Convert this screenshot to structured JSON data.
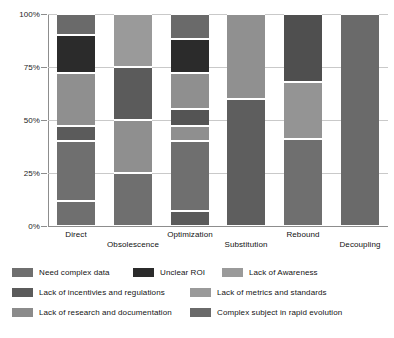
{
  "chart_data": {
    "type": "bar",
    "subtype": "stacked-percentage",
    "title": "",
    "subtitle": "",
    "xlabel": "",
    "ylabel": "",
    "ylim": [
      0,
      100
    ],
    "grid": true,
    "legend_position": "bottom",
    "categories": [
      "Direct",
      "Obsolescence",
      "Optimization",
      "Substitution",
      "Rebound",
      "Decoupling"
    ],
    "ytick_labels": [
      "0%",
      "25%",
      "50%",
      "75%",
      "100%"
    ],
    "ytick_values": [
      0,
      25,
      50,
      75,
      100
    ],
    "series": [
      {
        "name": "Need complex data",
        "color": "#6f6f6f",
        "values": [
          12,
          25,
          33,
          0,
          41,
          100
        ]
      },
      {
        "name": "Unclear ROI",
        "color": "#2b2b2b",
        "values": [
          0,
          0,
          7,
          0,
          0,
          0
        ]
      },
      {
        "name": "Lack of Awareness",
        "color": "#9a9a9a",
        "values": [
          0,
          25,
          0,
          0,
          0,
          0
        ]
      },
      {
        "name": "Lack of incentivies and regulations",
        "color": "#5b5b5b",
        "values": [
          28,
          0,
          0,
          60,
          0,
          0
        ]
      },
      {
        "name": "Lack of metrics and standards",
        "color": "#9a9a9a",
        "values": [
          0,
          0,
          7,
          0,
          0,
          0
        ]
      },
      {
        "name": "Lack of research and documentation",
        "color": "#8b8b8b",
        "values": [
          0,
          0,
          0,
          0,
          0,
          0
        ]
      },
      {
        "name": "Complex subject in rapid evolution",
        "color": "#6a6a6a",
        "values": [
          0,
          0,
          0,
          0,
          0,
          0
        ]
      }
    ],
    "stacks": [
      {
        "category": "Direct",
        "segments": [
          {
            "label": "Need complex data",
            "start": 0,
            "end": 12,
            "value": 12,
            "color": "#6f6f6f"
          },
          {
            "label": "Lack of incentivies and regulations",
            "start": 12,
            "end": 40,
            "value": 28,
            "color": "#6f6f6f"
          },
          {
            "label": "Lack of metrics and standards",
            "start": 40,
            "end": 47,
            "value": 7,
            "color": "#5b5b5b"
          },
          {
            "label": "Lack of research and documentation",
            "start": 47,
            "end": 72,
            "value": 25,
            "color": "#8f8f8f"
          },
          {
            "label": "Unclear ROI",
            "start": 72,
            "end": 90,
            "value": 18,
            "color": "#2b2b2b"
          },
          {
            "label": "Complex subject in rapid evolution",
            "start": 90,
            "end": 100,
            "value": 10,
            "color": "#6a6a6a"
          }
        ]
      },
      {
        "category": "Obsolescence",
        "segments": [
          {
            "label": "Need complex data",
            "start": 0,
            "end": 25,
            "value": 25,
            "color": "#6f6f6f"
          },
          {
            "label": "Lack of research and documentation",
            "start": 25,
            "end": 50,
            "value": 25,
            "color": "#8f8f8f"
          },
          {
            "label": "Lack of incentivies and regulations",
            "start": 50,
            "end": 75,
            "value": 25,
            "color": "#5b5b5b"
          },
          {
            "label": "Lack of Awareness",
            "start": 75,
            "end": 100,
            "value": 25,
            "color": "#9a9a9a"
          }
        ]
      },
      {
        "category": "Optimization",
        "segments": [
          {
            "label": "Lack of incentivies and regulations",
            "start": 0,
            "end": 7,
            "value": 7,
            "color": "#5b5b5b"
          },
          {
            "label": "Need complex data",
            "start": 7,
            "end": 40,
            "value": 33,
            "color": "#6f6f6f"
          },
          {
            "label": "Lack of metrics and standards",
            "start": 40,
            "end": 47,
            "value": 7,
            "color": "#8f8f8f"
          },
          {
            "label": "Complex subject in rapid evolution",
            "start": 47,
            "end": 55,
            "value": 8,
            "color": "#545454"
          },
          {
            "label": "Lack of research and documentation",
            "start": 55,
            "end": 72,
            "value": 17,
            "color": "#8f8f8f"
          },
          {
            "label": "Unclear ROI",
            "start": 72,
            "end": 88,
            "value": 16,
            "color": "#2b2b2b"
          },
          {
            "label": "Lack of Awareness",
            "start": 88,
            "end": 100,
            "value": 12,
            "color": "#6a6a6a"
          }
        ]
      },
      {
        "category": "Substitution",
        "segments": [
          {
            "label": "Lack of incentivies and regulations",
            "start": 0,
            "end": 60,
            "value": 60,
            "color": "#5e5e5e"
          },
          {
            "label": "Lack of Awareness",
            "start": 60,
            "end": 100,
            "value": 40,
            "color": "#909090"
          }
        ]
      },
      {
        "category": "Rebound",
        "segments": [
          {
            "label": "Need complex data",
            "start": 0,
            "end": 41,
            "value": 41,
            "color": "#6f6f6f"
          },
          {
            "label": "Lack of Awareness",
            "start": 41,
            "end": 68,
            "value": 27,
            "color": "#949494"
          },
          {
            "label": "Lack of incentivies and regulations",
            "start": 68,
            "end": 100,
            "value": 32,
            "color": "#4f4f4f"
          }
        ]
      },
      {
        "category": "Decoupling",
        "segments": [
          {
            "label": "Need complex data",
            "start": 0,
            "end": 100,
            "value": 100,
            "color": "#6a6a6a"
          }
        ]
      }
    ]
  },
  "legend": {
    "items": [
      {
        "label": "Need complex data",
        "color": "#6f6f6f"
      },
      {
        "label": "Unclear ROI",
        "color": "#2b2b2b"
      },
      {
        "label": "Lack of Awareness",
        "color": "#9a9a9a"
      },
      {
        "label": "Lack of incentivies and regulations",
        "color": "#5b5b5b"
      },
      {
        "label": "Lack of metrics and standards",
        "color": "#9a9a9a"
      },
      {
        "label": "Lack of research and documentation",
        "color": "#8b8b8b"
      },
      {
        "label": "Complex subject in rapid evolution",
        "color": "#6a6a6a"
      }
    ]
  }
}
